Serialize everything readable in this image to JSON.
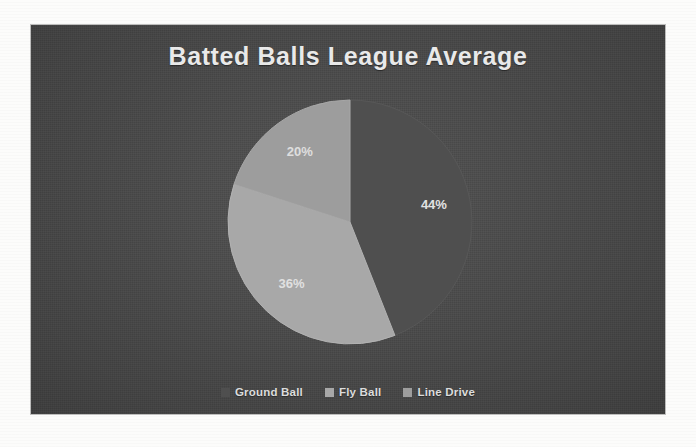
{
  "page": {
    "background_color": "#fcfcfb"
  },
  "chart_plate": {
    "background_color": "#4a4a4a"
  },
  "chart_data": {
    "type": "pie",
    "title": "Batted Balls League Average",
    "subtitle": "",
    "xlabel": "",
    "ylabel": "",
    "categories": [
      "Ground Ball",
      "Fly Ball",
      "Line Drive"
    ],
    "values": [
      44,
      36,
      20
    ],
    "labels": [
      "44%",
      "36%",
      "20%"
    ],
    "units": "percent",
    "colors": [
      "#4f4f4f",
      "#a8a8a8",
      "#9d9d9d"
    ],
    "start_angle_deg": 0,
    "direction": "clockwise",
    "legend_position": "bottom",
    "grid": false,
    "data_labels_shown": true,
    "slices": [
      {
        "name": "Ground Ball",
        "value": 44,
        "label": "44%",
        "color": "#4f4f4f"
      },
      {
        "name": "Fly Ball",
        "value": 36,
        "label": "36%",
        "color": "#a8a8a8"
      },
      {
        "name": "Line Drive",
        "value": 20,
        "label": "20%",
        "color": "#9d9d9d"
      }
    ]
  },
  "legend": {
    "items": [
      {
        "label": "Ground Ball",
        "color": "#4f4f4f"
      },
      {
        "label": "Fly Ball",
        "color": "#a8a8a8"
      },
      {
        "label": "Line Drive",
        "color": "#9d9d9d"
      }
    ]
  }
}
